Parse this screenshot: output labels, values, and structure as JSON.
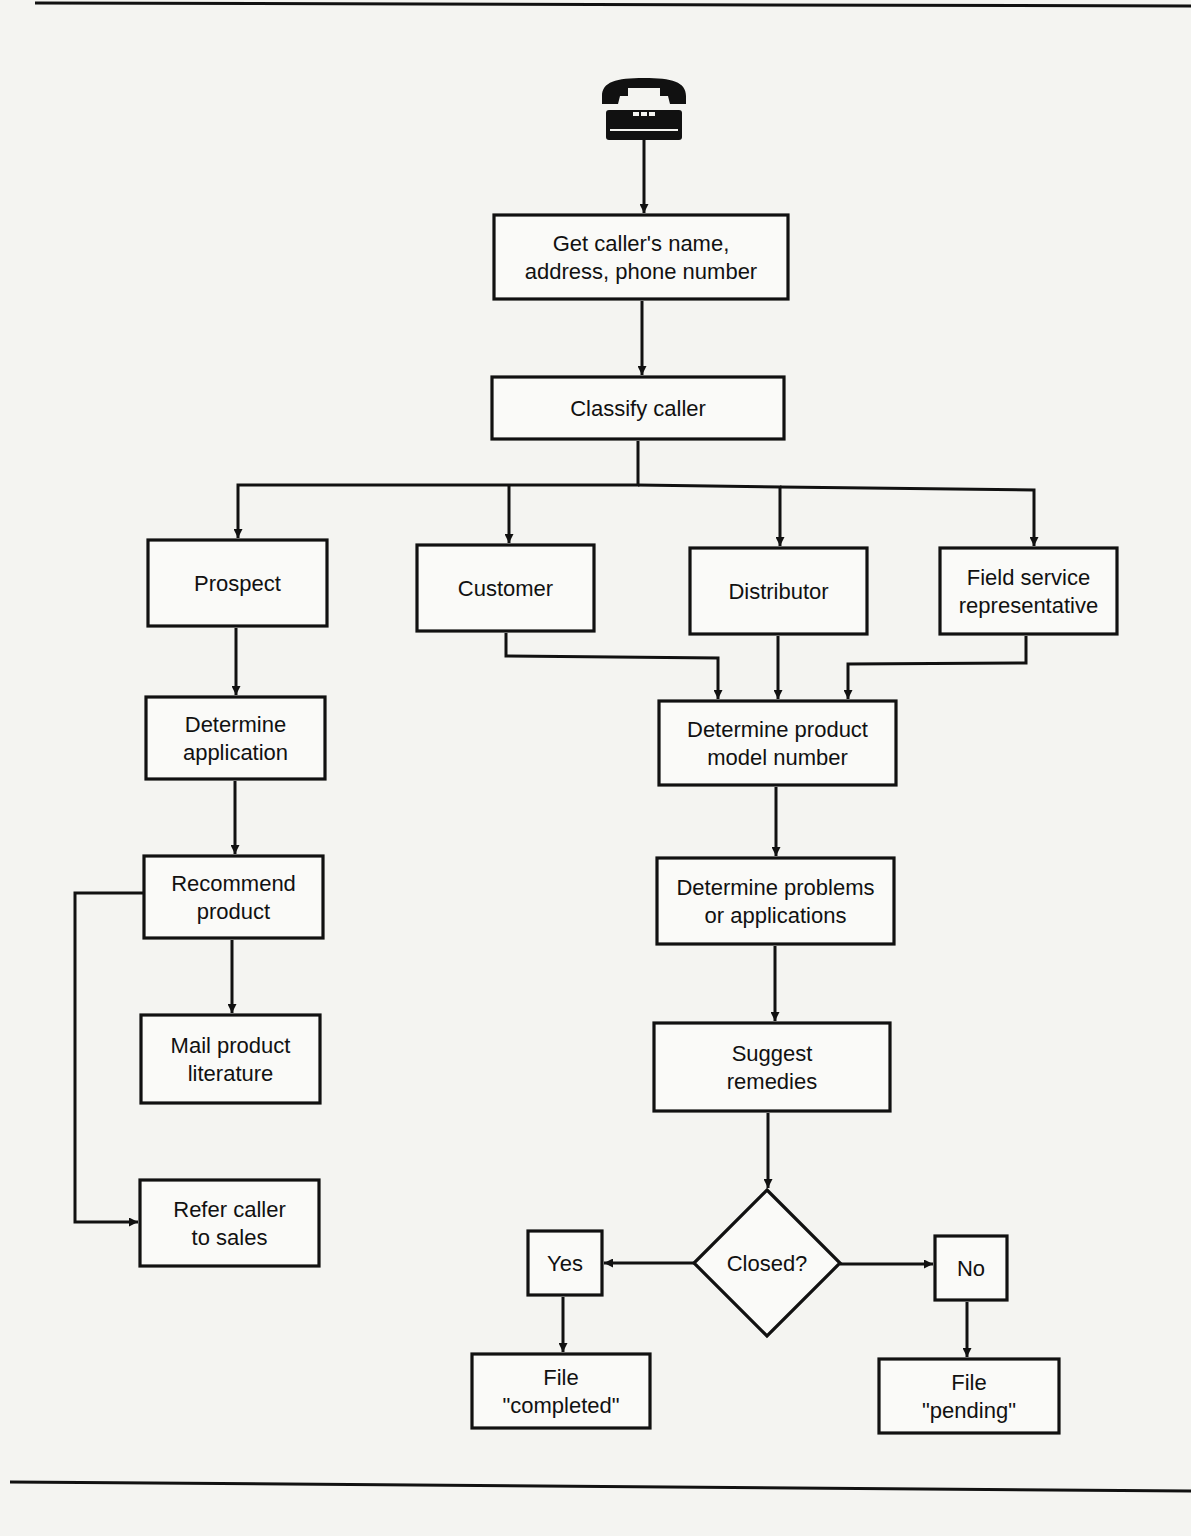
{
  "diagram": {
    "type": "flowchart",
    "title": "",
    "start_icon": "telephone-icon",
    "colors": {
      "ink": "#111111",
      "paper": "#f4f4f1",
      "box_fill": "#fafaf8"
    },
    "nodes": [
      {
        "id": "get_info",
        "shape": "rect",
        "lines": [
          "Get caller's name,",
          "address, phone number"
        ]
      },
      {
        "id": "classify",
        "shape": "rect",
        "lines": [
          "Classify caller"
        ]
      },
      {
        "id": "prospect",
        "shape": "rect",
        "lines": [
          "Prospect"
        ]
      },
      {
        "id": "customer",
        "shape": "rect",
        "lines": [
          "Customer"
        ]
      },
      {
        "id": "distributor",
        "shape": "rect",
        "lines": [
          "Distributor"
        ]
      },
      {
        "id": "field_rep",
        "shape": "rect",
        "lines": [
          "Field service",
          "representative"
        ]
      },
      {
        "id": "det_application",
        "shape": "rect",
        "lines": [
          "Determine",
          "application"
        ]
      },
      {
        "id": "recommend",
        "shape": "rect",
        "lines": [
          "Recommend",
          "product"
        ]
      },
      {
        "id": "mail_lit",
        "shape": "rect",
        "lines": [
          "Mail product",
          "literature"
        ]
      },
      {
        "id": "refer_sales",
        "shape": "rect",
        "lines": [
          "Refer caller",
          "to sales"
        ]
      },
      {
        "id": "det_model",
        "shape": "rect",
        "lines": [
          "Determine product",
          "model number"
        ]
      },
      {
        "id": "det_problems",
        "shape": "rect",
        "lines": [
          "Determine problems",
          "or applications"
        ]
      },
      {
        "id": "suggest",
        "shape": "rect",
        "lines": [
          "Suggest",
          "remedies"
        ]
      },
      {
        "id": "closed",
        "shape": "diamond",
        "lines": [
          "Closed?"
        ]
      },
      {
        "id": "yes",
        "shape": "rect",
        "lines": [
          "Yes"
        ]
      },
      {
        "id": "no",
        "shape": "rect",
        "lines": [
          "No"
        ]
      },
      {
        "id": "file_completed",
        "shape": "rect",
        "lines": [
          "File",
          "\"completed\""
        ]
      },
      {
        "id": "file_pending",
        "shape": "rect",
        "lines": [
          "File",
          "\"pending\""
        ]
      }
    ],
    "edges": [
      {
        "from": "telephone",
        "to": "get_info"
      },
      {
        "from": "get_info",
        "to": "classify"
      },
      {
        "from": "classify",
        "to": "prospect"
      },
      {
        "from": "classify",
        "to": "customer"
      },
      {
        "from": "classify",
        "to": "distributor"
      },
      {
        "from": "classify",
        "to": "field_rep"
      },
      {
        "from": "prospect",
        "to": "det_application"
      },
      {
        "from": "det_application",
        "to": "recommend"
      },
      {
        "from": "recommend",
        "to": "mail_lit"
      },
      {
        "from": "recommend",
        "to": "refer_sales"
      },
      {
        "from": "customer",
        "to": "det_model"
      },
      {
        "from": "distributor",
        "to": "det_model"
      },
      {
        "from": "field_rep",
        "to": "det_model"
      },
      {
        "from": "det_model",
        "to": "det_problems"
      },
      {
        "from": "det_problems",
        "to": "suggest"
      },
      {
        "from": "suggest",
        "to": "closed"
      },
      {
        "from": "closed",
        "to": "yes"
      },
      {
        "from": "closed",
        "to": "no"
      },
      {
        "from": "yes",
        "to": "file_completed"
      },
      {
        "from": "no",
        "to": "file_pending"
      }
    ]
  }
}
